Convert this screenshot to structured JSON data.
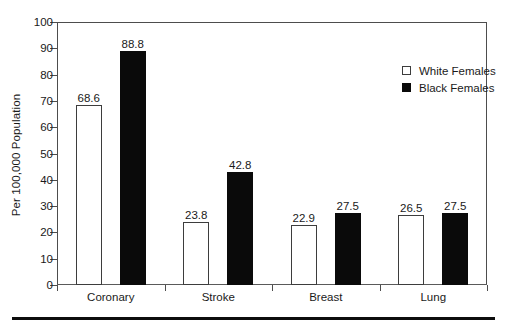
{
  "chart_data": {
    "type": "bar",
    "title": "",
    "xlabel": "",
    "ylabel": "Per 100,000 Population",
    "ylim": [
      0,
      100
    ],
    "yticks": [
      0,
      10,
      20,
      30,
      40,
      50,
      60,
      70,
      80,
      90,
      100
    ],
    "grid": false,
    "legend_position": "top-right",
    "categories": [
      "Coronary",
      "Stroke",
      "Breast",
      "Lung"
    ],
    "series": [
      {
        "name": "White Females",
        "swatch": "open-square",
        "color": "#ffffff",
        "edge_color": "#3d3d3d",
        "values": [
          68.6,
          23.8,
          22.9,
          26.5
        ],
        "labels": [
          "68.6",
          "23.8",
          "22.9",
          "26.5"
        ]
      },
      {
        "name": "Black Females",
        "swatch": "filled-square",
        "color": "#0a0a0a",
        "edge_color": "#0a0a0a",
        "values": [
          88.8,
          42.8,
          27.5,
          27.5
        ],
        "labels": [
          "88.8",
          "42.8",
          "27.5",
          "27.5"
        ]
      }
    ]
  },
  "axis": {
    "ytick_labels": [
      "0",
      "10",
      "20",
      "30",
      "40",
      "50",
      "60",
      "70",
      "80",
      "90",
      "100"
    ],
    "ylabel": "Per 100,000 Population"
  },
  "legend": {
    "entries": [
      {
        "label": "White Females",
        "style": "white"
      },
      {
        "label": "Black Females",
        "style": "black"
      }
    ]
  }
}
